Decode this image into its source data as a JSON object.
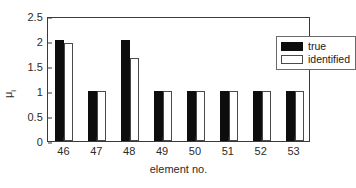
{
  "chart_data": {
    "type": "bar",
    "title": "",
    "xlabel": "element no.",
    "ylabel": "μ",
    "ylabel_subscript": "i",
    "categories": [
      "46",
      "47",
      "48",
      "49",
      "50",
      "51",
      "52",
      "53"
    ],
    "series": [
      {
        "name": "true",
        "color": "#0d0d0d",
        "fill": "solid",
        "values": [
          2.03,
          1.0,
          2.03,
          1.0,
          1.0,
          1.0,
          1.0,
          1.0
        ]
      },
      {
        "name": "identified",
        "color": "#ffffff",
        "fill": "outline",
        "values": [
          1.97,
          1.0,
          1.67,
          1.0,
          1.0,
          1.0,
          1.0,
          1.0
        ]
      }
    ],
    "ylim": [
      0,
      2.5
    ],
    "yticks": [
      "0",
      "0.5",
      "1",
      "1.5",
      "2",
      "2.5"
    ],
    "ytick_values": [
      0,
      0.5,
      1,
      1.5,
      2,
      2.5
    ],
    "grid": false,
    "legend_position": "top-right-inside",
    "axis_color": "#3a3a3a",
    "background": "#ffffff"
  },
  "legend": {
    "entries": [
      {
        "label": "true"
      },
      {
        "label": "identified"
      }
    ]
  }
}
